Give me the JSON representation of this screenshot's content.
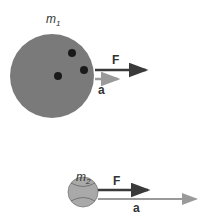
{
  "body1": {
    "mass_label": "m",
    "mass_sub": "1",
    "force_label": "F",
    "accel_label": "a"
  },
  "body2": {
    "mass_label": "m",
    "mass_sub": "2",
    "force_label": "F",
    "accel_label": "a"
  },
  "colors": {
    "ball1": "#7a7a7a",
    "ball2": "#a9a9a9",
    "force_arrow": "#3a3a3a",
    "accel_arrow": "#9a9a9a"
  }
}
